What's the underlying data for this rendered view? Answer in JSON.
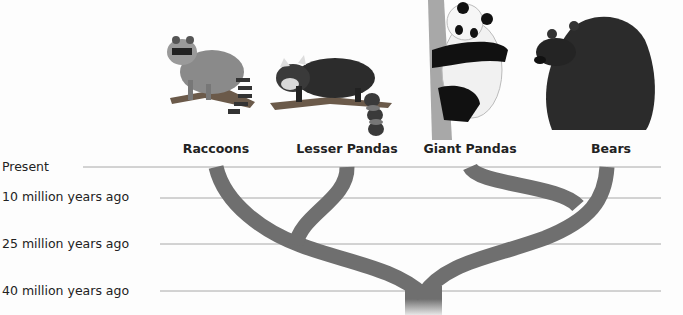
{
  "diagram": {
    "type": "phylogenetic-tree",
    "taxa": [
      {
        "label": "Raccoons",
        "x": 216
      },
      {
        "label": "Lesser Pandas",
        "x": 347
      },
      {
        "label": "Giant Pandas",
        "x": 470
      },
      {
        "label": "Bears",
        "x": 612
      }
    ],
    "time_scale": [
      {
        "label": "Present",
        "y": 167
      },
      {
        "label": "10 million years ago",
        "y": 198
      },
      {
        "label": "25 million years ago",
        "y": 244
      },
      {
        "label": "40 million years ago",
        "y": 291
      }
    ],
    "colors": {
      "branch": "#6f6f6f",
      "gridline": "#a8a8a8",
      "text": "#222222"
    }
  }
}
